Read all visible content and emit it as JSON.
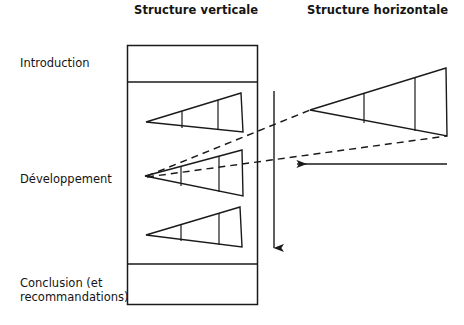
{
  "titles": {
    "vertical": "Structure verticale",
    "horizontal": "Structure horizontale"
  },
  "row_labels": {
    "introduction": "Introduction",
    "developpement": "Développement",
    "conclusion": "Conclusion (et recommandations)"
  },
  "colors": {
    "ink": "#1a1a1a",
    "paper": "#ffffff"
  },
  "diagram": {
    "type": "schematic",
    "vertical_structure": {
      "outer_box": {
        "x": 127,
        "y": 45,
        "width": 131,
        "height": 260
      },
      "dividers_y": [
        82,
        264
      ],
      "sections": [
        "Introduction",
        "Développement",
        "Conclusion (et recommandations)"
      ],
      "triangles": [
        {
          "apex": [
            146,
            122
          ],
          "top_right": [
            241,
            93
          ],
          "bottom_right": [
            243,
            132
          ],
          "internal_verticals_x": [
            182,
            218
          ]
        },
        {
          "apex": [
            145,
            176
          ],
          "top_right": [
            242,
            150
          ],
          "bottom_right": [
            243,
            196
          ],
          "internal_verticals_x": [
            181,
            219
          ]
        },
        {
          "apex": [
            146,
            235
          ],
          "top_right": [
            240,
            207
          ],
          "bottom_right": [
            242,
            247
          ],
          "internal_verticals_x": [
            181,
            219
          ]
        }
      ],
      "down_arrow": {
        "x": 274,
        "y_start": 91,
        "y_end": 256,
        "direction": "down"
      }
    },
    "horizontal_structure": {
      "triangle": {
        "apex": [
          310,
          110
        ],
        "top_right": [
          446,
          68
        ],
        "bottom_right": [
          447,
          136
        ],
        "internal_verticals_x": [
          364,
          415
        ]
      },
      "left_arrow": {
        "x_start": 447,
        "x_end": 288,
        "y": 164,
        "direction": "left"
      }
    },
    "connectors": [
      {
        "style": "dashed",
        "from": [
          145,
          176
        ],
        "to": [
          310,
          110
        ]
      },
      {
        "style": "dashed",
        "from": [
          145,
          176
        ],
        "to": [
          447,
          136
        ]
      }
    ]
  }
}
